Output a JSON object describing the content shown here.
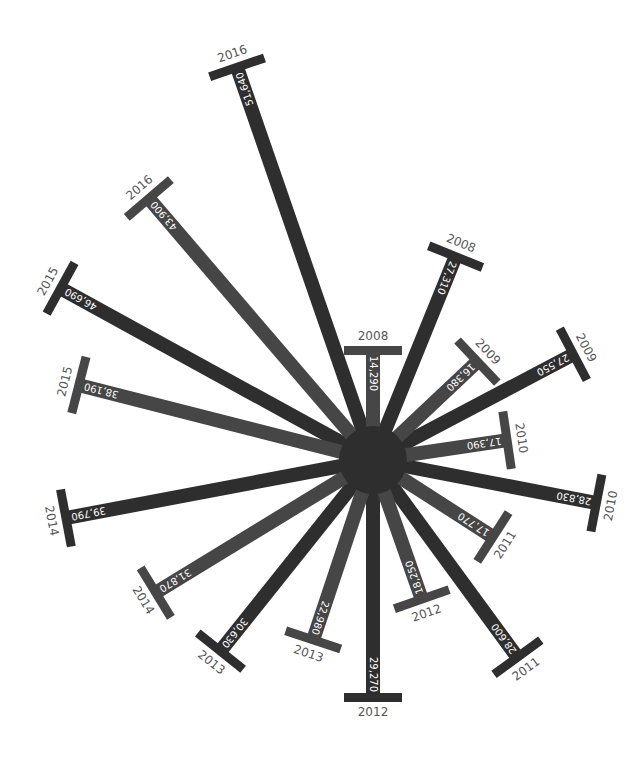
{
  "chart_data": {
    "type": "radial-bar",
    "title": "",
    "center": [
      373,
      460
    ],
    "center_radius": 34,
    "colors": {
      "series_a": "#2e2e2e",
      "series_b": "#464646",
      "year_label": "#555555",
      "value_label": "#ffffff"
    },
    "series": [
      {
        "name": "outer",
        "color": "#2e2e2e",
        "points": [
          {
            "year": "2008",
            "value": 27310,
            "label": "27,310",
            "angle": 22.1,
            "length": 220
          },
          {
            "year": "2009",
            "value": 27550,
            "label": "27,550",
            "angle": 62.2,
            "length": 227
          },
          {
            "year": "2010",
            "value": 28830,
            "label": "28,830",
            "angle": 100.9,
            "length": 228
          },
          {
            "year": "2011",
            "value": 28600,
            "label": "28,600",
            "angle": 143.8,
            "length": 245
          },
          {
            "year": "2012",
            "value": 29270,
            "label": "29,270",
            "angle": 180.0,
            "length": 238
          },
          {
            "year": "2013",
            "value": 30630,
            "label": "30,630",
            "angle": 218.6,
            "length": 245
          },
          {
            "year": "2014",
            "value": 39790,
            "label": "39,790",
            "angle": 259.3,
            "length": 313
          },
          {
            "year": "2015",
            "value": 46690,
            "label": "46,690",
            "angle": 298.8,
            "length": 357
          },
          {
            "year": "2016",
            "value": 51640,
            "label": "51,640",
            "angle": 340.9,
            "length": 416
          }
        ]
      },
      {
        "name": "inner",
        "color": "#464646",
        "points": [
          {
            "year": "2008",
            "value": 14290,
            "label": "14,290",
            "angle": 0.0,
            "length": 110
          },
          {
            "year": "2009",
            "value": 16380,
            "label": "16,380",
            "angle": 46.7,
            "length": 144
          },
          {
            "year": "2010",
            "value": 17390,
            "label": "17,390",
            "angle": 81.6,
            "length": 136
          },
          {
            "year": "2011",
            "value": 17770,
            "label": "17,770",
            "angle": 122.7,
            "length": 143
          },
          {
            "year": "2012",
            "value": 18250,
            "label": "18,250",
            "angle": 160.7,
            "length": 148
          },
          {
            "year": "2013",
            "value": 22980,
            "label": "22,980",
            "angle": 198.4,
            "length": 190
          },
          {
            "year": "2014",
            "value": 31870,
            "label": "31,870",
            "angle": 238.6,
            "length": 255
          },
          {
            "year": "2015",
            "value": 38190,
            "label": "38,190",
            "angle": 284.3,
            "length": 304
          },
          {
            "year": "2016",
            "value": 43900,
            "label": "43,900",
            "angle": 319.4,
            "length": 345
          }
        ]
      }
    ]
  }
}
